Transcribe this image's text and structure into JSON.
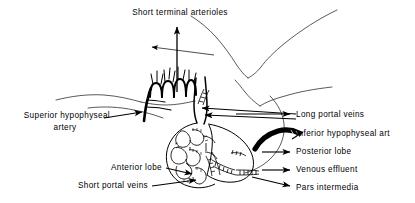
{
  "figure": {
    "title": "Short terminal arterioles",
    "background_color": "#ffffff",
    "ink_color": "#000000"
  },
  "labels": {
    "short_terminal_arterioles": "Short terminal arterioles",
    "superior_hypophyseal_artery_line1": "Superior hypophyseal",
    "superior_hypophyseal_artery_line2": "artery",
    "long_portal_veins": "Long portal veins",
    "inferior_hypophyseal_artery": "Inferior hypophyseal art",
    "posterior_lobe": "Posterior lobe",
    "venous_effluent": "Venous effluent",
    "pars_intermedia": "Pars intermedia",
    "anterior_lobe": "Anterior lobe",
    "short_portal_veins": "Short portal veins"
  },
  "annotations": {
    "arrow_count": 9,
    "leader_style": "solid-black-arrow"
  }
}
